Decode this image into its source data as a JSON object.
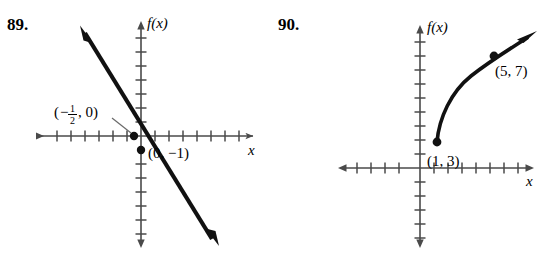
{
  "page": {
    "background_color": "#ffffff",
    "ink_color": "#000000",
    "axis_color": "#4a4a4a"
  },
  "problems": [
    {
      "number": "89.",
      "graph": {
        "type": "line",
        "y_axis_label": "f(x)",
        "x_axis_label": "x",
        "description": "Decreasing straight line with arrowheads on both ends",
        "slope": -2,
        "intercepts": {
          "x_intercept": "-1/2",
          "y_intercept": "-1"
        },
        "labels": [
          {
            "text_open_paren": "(",
            "minus": "−",
            "numerator": "1",
            "denominator": "2",
            "text_after": ", 0)",
            "full": "(−1/2, 0)",
            "has_leader_line": true
          },
          {
            "full": "(0, −1)",
            "has_leader_line": false
          }
        ],
        "marked_points": [
          {
            "label": "(−1/2, 0)",
            "x": -0.5,
            "y": 0
          },
          {
            "label": "(0, −1)",
            "x": 0,
            "y": -1
          }
        ],
        "axis_ticks": {
          "x_count": 15,
          "y_count": 15,
          "spacing_px": 14
        }
      }
    },
    {
      "number": "90.",
      "graph": {
        "type": "curve",
        "y_axis_label": "f(x)",
        "x_axis_label": "x",
        "description": "Increasing concave-down curve starting at a closed dot, arrowhead at upper right",
        "labels": [
          {
            "full": "(1, 3)",
            "has_leader_line": false
          },
          {
            "full": "(5, 7)",
            "has_leader_line": false
          }
        ],
        "marked_points": [
          {
            "label": "(1, 3)",
            "x": 1,
            "y": 3,
            "endpoint": "closed"
          },
          {
            "label": "(5, 7)",
            "x": 5,
            "y": 7,
            "endpoint": "on-curve"
          }
        ],
        "axis_ticks": {
          "x_count": 14,
          "y_count": 14,
          "spacing_px": 14
        }
      }
    }
  ]
}
